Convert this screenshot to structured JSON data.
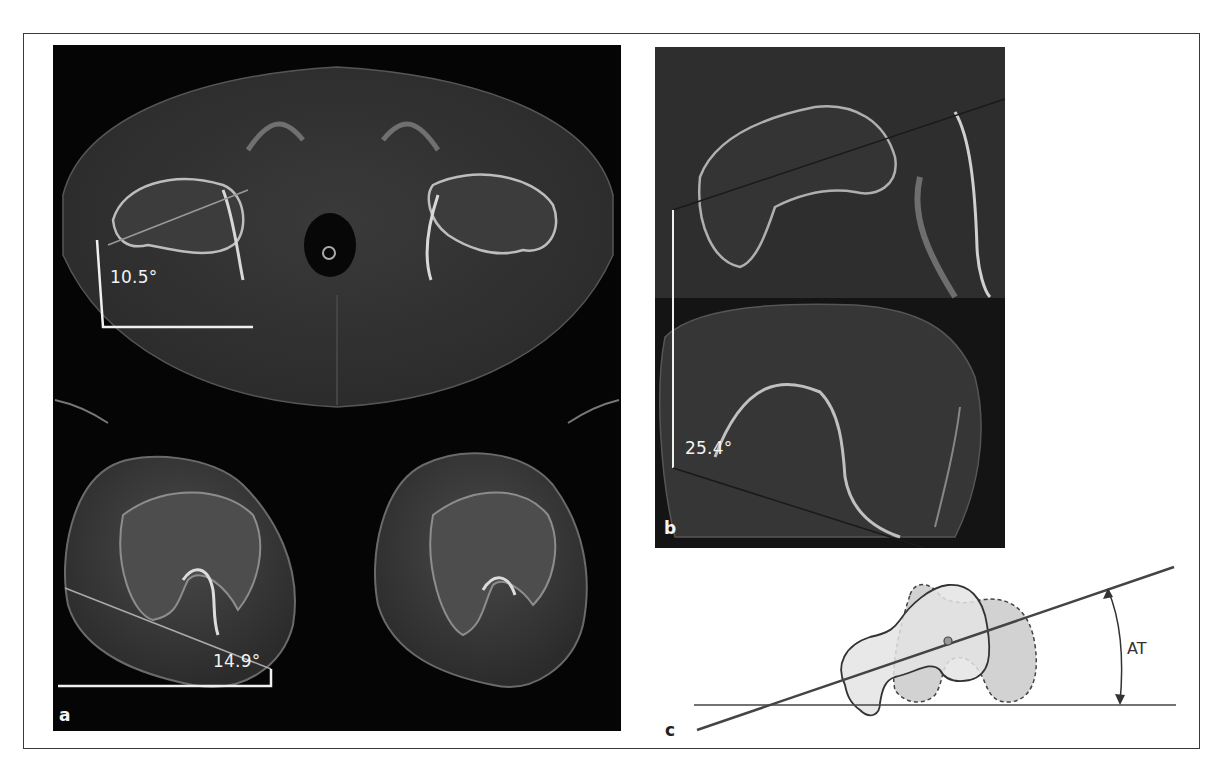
{
  "figure": {
    "panels": [
      {
        "id": "a",
        "label": "a",
        "description": "Axial CT of pelvis (hips) and both knees with femoral angle measurements",
        "measurements": [
          {
            "location": "right femoral neck (hip)",
            "value": "10.5°"
          },
          {
            "location": "right distal femur (knee)",
            "value": "14.9°"
          }
        ]
      },
      {
        "id": "b",
        "label": "b",
        "description": "Superimposed hip and knee CT slices with femoral antetorsion measurement",
        "measurements": [
          {
            "location": "combined hip-knee",
            "value": "25.4°"
          }
        ]
      },
      {
        "id": "c",
        "label": "c",
        "description": "Schematic of femoral neck axis over posterior condylar line showing antetorsion angle",
        "annotations": [
          {
            "label": "AT",
            "meaning": "antetorsion angle"
          }
        ]
      }
    ]
  },
  "colors": {
    "background": "#ffffff",
    "frame_border": "#3a3a3a",
    "ct_background": "#050505",
    "measure_line": "#f0f0f0",
    "diagram_line": "#555555",
    "diagram_fill_dark": "#cfcfcf",
    "diagram_fill_light": "#e6e6e6"
  }
}
